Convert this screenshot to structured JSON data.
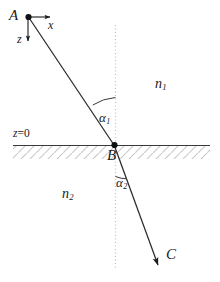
{
  "figure": {
    "type": "optics-refraction-diagram",
    "width": 220,
    "height": 282,
    "background_color": "#ffffff",
    "stroke_color": "#1a1a1a",
    "hatch_color": "#c8c8c8",
    "normal_line_color": "#bfbfbf"
  },
  "points": {
    "source": {
      "label": "A",
      "x": 28,
      "y": 17
    },
    "interface_point": {
      "label": "B",
      "x": 114,
      "y": 145
    },
    "target": {
      "label": "C",
      "x": 158,
      "y": 265
    }
  },
  "axes": {
    "x_label": "x",
    "z_label": "z",
    "origin_label": "z=0",
    "origin_label_italic_part": "z",
    "origin_label_rest": "=0"
  },
  "media": {
    "upper": {
      "symbol": "n",
      "subscript": "1"
    },
    "lower": {
      "symbol": "n",
      "subscript": "2"
    }
  },
  "angles": {
    "incidence": {
      "symbol": "α",
      "subscript": "1"
    },
    "refraction": {
      "symbol": "α",
      "subscript": "2"
    }
  },
  "rays": {
    "incident": {
      "from": "A",
      "to": "B"
    },
    "refracted": {
      "from": "B",
      "to": "C"
    }
  }
}
